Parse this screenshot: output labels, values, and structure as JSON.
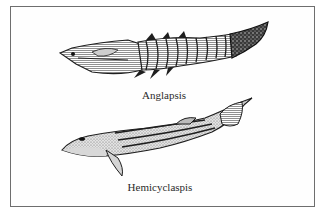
{
  "figure": {
    "specimens": [
      {
        "name": "Anglapsis",
        "label_pos": {
          "x": 164,
          "y": 89
        }
      },
      {
        "name": "Hemicyclaspis",
        "label_pos": {
          "x": 160,
          "y": 181
        }
      }
    ]
  },
  "colors": {
    "border": "#6e6e6e",
    "ink": "#1e1e1e",
    "shade": "#b8b8b8",
    "background": "#ffffff"
  }
}
